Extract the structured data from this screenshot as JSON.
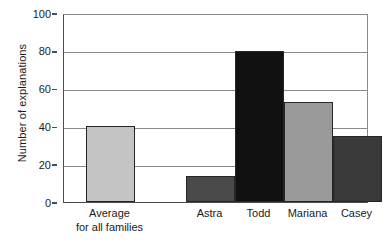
{
  "chart_data": {
    "type": "bar",
    "title": "",
    "xlabel": "",
    "ylabel": "Number of explanations",
    "ylim": [
      0,
      100
    ],
    "yticks": [
      0,
      20,
      40,
      60,
      80,
      100
    ],
    "ytick_labels": [
      "0",
      "20",
      "40",
      "60",
      "80",
      "100"
    ],
    "grid": "horizontal",
    "legend": "none",
    "categories": [
      "Average\nfor all families",
      "Astra",
      "Todd",
      "Mariana",
      "Casey"
    ],
    "values": [
      40,
      14,
      80,
      53,
      35
    ],
    "bar_colors": [
      "#c4c4c4",
      "#4a4a4a",
      "#111111",
      "#9a9a9a",
      "#3a3a3a"
    ]
  },
  "axis": {
    "y_title": "Number of explanations",
    "ticks": [
      {
        "label": "100",
        "value": 100
      },
      {
        "label": "80",
        "value": 80
      },
      {
        "label": "60",
        "value": 60
      },
      {
        "label": "40",
        "value": 40
      },
      {
        "label": "20",
        "value": 20
      },
      {
        "label": "0",
        "value": 0
      }
    ]
  },
  "bars": [
    {
      "label_line1": "Average",
      "label_line2": "for all families",
      "value": 40,
      "color": "#c4c4c4"
    },
    {
      "label_line1": "Astra",
      "label_line2": "",
      "value": 14,
      "color": "#4a4a4a"
    },
    {
      "label_line1": "Todd",
      "label_line2": "",
      "value": 80,
      "color": "#111111"
    },
    {
      "label_line1": "Mariana",
      "label_line2": "",
      "value": 53,
      "color": "#9a9a9a"
    },
    {
      "label_line1": "Casey",
      "label_line2": "",
      "value": 35,
      "color": "#3a3a3a"
    }
  ]
}
